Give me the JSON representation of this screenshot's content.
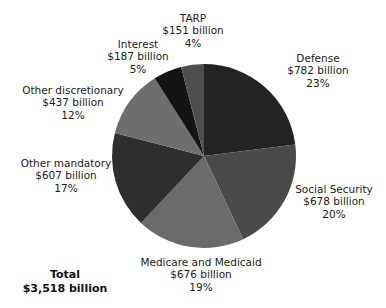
{
  "chart_data": {
    "type": "pie",
    "title": "",
    "subtitle": "",
    "xlabel": "",
    "ylabel": "",
    "legend_position": "callout-labels",
    "grid": false,
    "units": "billions of dollars",
    "start_angle_deg": 0,
    "direction": "clockwise",
    "categories": [
      "Defense",
      "Social Security",
      "Medicare and Medicaid",
      "Other mandatory",
      "Other discretionary",
      "Interest",
      "TARP"
    ],
    "values": [
      782,
      678,
      676,
      607,
      437,
      187,
      151
    ],
    "percents": [
      23,
      20,
      19,
      17,
      12,
      5,
      4
    ],
    "colors": [
      "#232323",
      "#4a4a4a",
      "#6a6a6a",
      "#2e2e2e",
      "#6e6e6e",
      "#141414",
      "#4e4e4e"
    ],
    "total_value": 3518,
    "slices": [
      {
        "key": "defense",
        "label": "Defense",
        "amount": "$782 billion",
        "percent_label": "23%",
        "value": 782,
        "percent": 23,
        "color": "#232323"
      },
      {
        "key": "social_security",
        "label": "Social Security",
        "amount": "$678 billion",
        "percent_label": "20%",
        "value": 678,
        "percent": 20,
        "color": "#4a4a4a"
      },
      {
        "key": "medicare_medicaid",
        "label": "Medicare and Medicaid",
        "amount": "$676 billion",
        "percent_label": "19%",
        "value": 676,
        "percent": 19,
        "color": "#6a6a6a"
      },
      {
        "key": "other_mandatory",
        "label": "Other mandatory",
        "amount": "$607 billion",
        "percent_label": "17%",
        "value": 607,
        "percent": 17,
        "color": "#2e2e2e"
      },
      {
        "key": "other_discretionary",
        "label": "Other discretionary",
        "amount": "$437 billion",
        "percent_label": "12%",
        "value": 437,
        "percent": 12,
        "color": "#6e6e6e"
      },
      {
        "key": "interest",
        "label": "Interest",
        "amount": "$187 billion",
        "percent_label": "5%",
        "value": 187,
        "percent": 5,
        "color": "#141414"
      },
      {
        "key": "tarp",
        "label": "TARP",
        "amount": "$151 billion",
        "percent_label": "4%",
        "value": 151,
        "percent": 4,
        "color": "#4e4e4e"
      }
    ],
    "total": {
      "label": "Total",
      "amount": "$3,518 billion"
    }
  },
  "geometry": {
    "center_x": 204,
    "center_y": 156,
    "radius": 92
  }
}
